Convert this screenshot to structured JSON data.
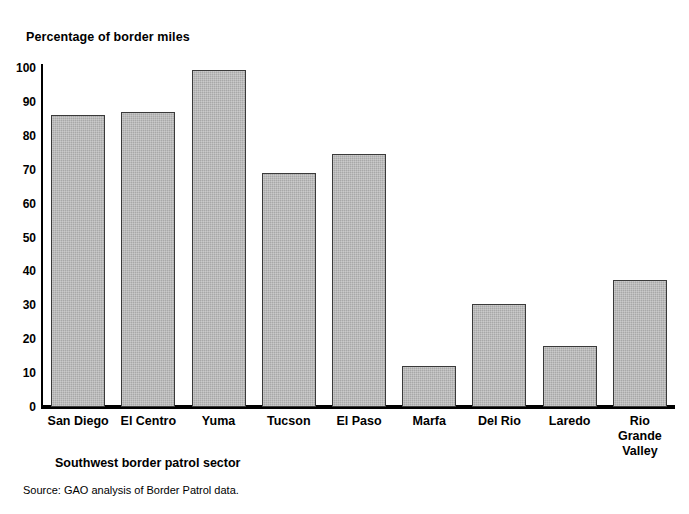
{
  "chart_data": {
    "type": "bar",
    "title": "Percentage of border miles",
    "xlabel": "Southwest border patrol sector",
    "ylabel": "",
    "ylim": [
      0,
      100
    ],
    "yticks": [
      0,
      10,
      20,
      30,
      40,
      50,
      60,
      70,
      80,
      90,
      100
    ],
    "grid": false,
    "legend": null,
    "categories": [
      "San Diego",
      "El Centro",
      "Yuma",
      "Tucson",
      "El Paso",
      "Marfa",
      "Del Rio",
      "Laredo",
      "Rio\nGrande\nValley"
    ],
    "values": [
      86,
      87,
      99.5,
      69,
      74.5,
      12,
      30.5,
      18,
      37.5
    ],
    "bar_color": "#a8a8a8",
    "bar_edge_color": "#3a3a3a",
    "source": "Source: GAO analysis of Border Patrol data."
  }
}
